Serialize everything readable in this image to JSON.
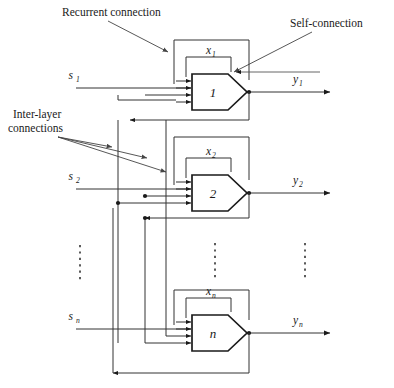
{
  "figure": {
    "type": "diagram",
    "annotations": {
      "recurrent": "Recurrent connection",
      "self": "Self-connection",
      "interlayer_line1": "Inter-layer",
      "interlayer_line2": "connections"
    },
    "neurons": [
      {
        "id": "1",
        "label": "1",
        "input": "s",
        "input_sub": "1",
        "state": "x",
        "state_sub": "1",
        "output": "y",
        "output_sub": "1"
      },
      {
        "id": "2",
        "label": "2",
        "input": "s",
        "input_sub": "2",
        "state": "x",
        "state_sub": "2",
        "output": "y",
        "output_sub": "2"
      },
      {
        "id": "n",
        "label": "n",
        "input": "s",
        "input_sub": "n",
        "state": "x",
        "state_sub": "n",
        "output": "y",
        "output_sub": "n"
      }
    ],
    "ellipsis_count": 3,
    "inputs_per_neuron": 4,
    "colors": {
      "ink": "#1a1a1a",
      "wire": "#333333",
      "leader": "#444444",
      "background": "#ffffff"
    }
  }
}
